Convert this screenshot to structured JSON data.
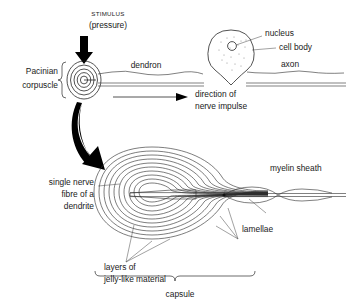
{
  "figure": {
    "background_color": "#ffffff",
    "line_color": "#1a1a1a",
    "core_fill_color": "#b3b3b3",
    "arrow_color": "#000000"
  },
  "labels": {
    "stimulus": "STIMULUS",
    "pressure": "(pressure)",
    "pacinian_line1": "Pacinian",
    "pacinian_line2": "corpuscle",
    "dendron": "dendron",
    "nucleus": "nucleus",
    "cell_body": "cell body",
    "axon": "axon",
    "direction_line1": "direction of",
    "direction_line2": "nerve impulse",
    "single_nerve_line1": "single nerve",
    "single_nerve_line2": "fibre of a",
    "single_nerve_line3": "dendrite",
    "myelin_sheath": "myelin sheath",
    "lamellae": "lamellae",
    "jelly_line1": "layers of",
    "jelly_line2": "jelly-like material",
    "capsule": "capsule"
  },
  "structures": {
    "lamellae_count": 10,
    "corpuscle_spiral_turns": 4
  }
}
